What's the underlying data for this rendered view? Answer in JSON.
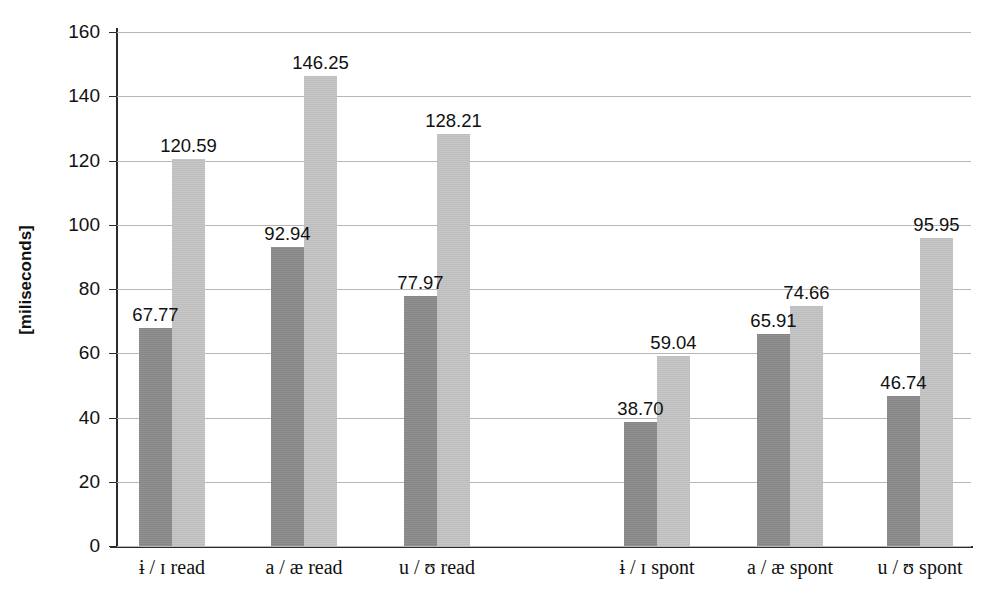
{
  "chart_data": {
    "type": "bar",
    "title": "",
    "subtitle": "",
    "xlabel": "",
    "ylabel": "[miliseconds]",
    "ylim": [
      0,
      160
    ],
    "ytick_step": 20,
    "yticks": [
      "160",
      "140",
      "120",
      "100",
      "80",
      "60",
      "40",
      "20",
      "0"
    ],
    "grid": true,
    "legend": "none",
    "categories": [
      "ɨ / ɪ read",
      "a / æ read",
      "u / ʊ read",
      "ɨ / ɪ spont",
      "a / æ spont",
      "u / ʊ spont"
    ],
    "series": [
      {
        "name": "series-dark",
        "color": "#8c8c8c",
        "values": [
          67.77,
          92.94,
          77.97,
          38.7,
          65.91,
          46.74
        ],
        "labels": [
          "67.77",
          "92.94",
          "77.97",
          "38.70",
          "65.91",
          "46.74"
        ]
      },
      {
        "name": "series-light",
        "color": "#c4c4c4",
        "values": [
          120.59,
          146.25,
          128.21,
          59.04,
          74.66,
          95.95
        ],
        "labels": [
          "120.59",
          "146.25",
          "128.21",
          "59.04",
          "74.66",
          "95.95"
        ]
      }
    ],
    "colors": {
      "axis": "#2b2b2b",
      "gridline": "#b6b6b6",
      "text": "#111111",
      "background": "#ffffff"
    }
  }
}
